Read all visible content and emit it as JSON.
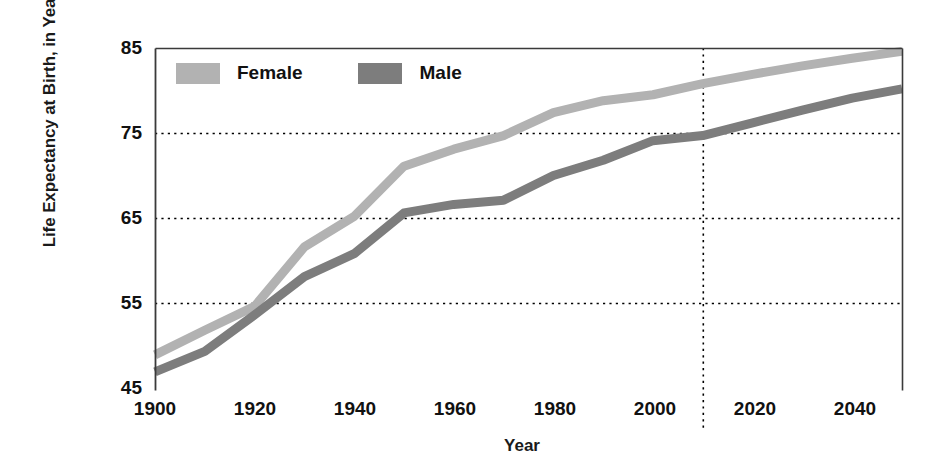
{
  "chart_data": {
    "type": "line",
    "title": "",
    "xlabel": "Year",
    "ylabel": "Life Expectancy at Birth, in Years",
    "xlim": [
      1900,
      2050
    ],
    "ylim": [
      45,
      85
    ],
    "xticks": [
      1900,
      1920,
      1940,
      1960,
      1980,
      2000,
      2020,
      2040
    ],
    "yticks": [
      45,
      55,
      65,
      75,
      85
    ],
    "grid": "horizontal dotted at 55, 65, 75; vertical dotted at 2010",
    "projection_line_year": 2010,
    "legend_position": "top-left inside plot",
    "series": [
      {
        "name": "Female",
        "color": "#b2b2b2",
        "x": [
          1900,
          1910,
          1920,
          1930,
          1940,
          1950,
          1960,
          1970,
          1980,
          1990,
          2000,
          2010,
          2020,
          2030,
          2040,
          2050
        ],
        "values": [
          48.9,
          51.8,
          54.6,
          61.6,
          65.2,
          71.1,
          73.1,
          74.7,
          77.4,
          78.8,
          79.5,
          80.8,
          81.9,
          82.9,
          83.8,
          84.6
        ]
      },
      {
        "name": "Male",
        "color": "#7d7d7d",
        "x": [
          1900,
          1910,
          1920,
          1930,
          1940,
          1950,
          1960,
          1970,
          1980,
          1990,
          2000,
          2010,
          2020,
          2030,
          2040,
          2050
        ],
        "values": [
          46.9,
          49.3,
          53.6,
          58.1,
          60.8,
          65.6,
          66.6,
          67.1,
          70.0,
          71.8,
          74.1,
          74.7,
          76.2,
          77.7,
          79.1,
          80.2
        ]
      }
    ]
  },
  "legend": {
    "items": [
      {
        "label": "Female",
        "color": "#b2b2b2"
      },
      {
        "label": "Male",
        "color": "#7d7d7d"
      }
    ]
  },
  "axes": {
    "y_title": "Life Expectancy at Birth, in Years",
    "x_title": "Year",
    "y_tick_labels": [
      "85",
      "75",
      "65",
      "55",
      "45"
    ],
    "x_tick_labels": [
      "1900",
      "1920",
      "1940",
      "1960",
      "1980",
      "2000",
      "2020",
      "2040"
    ]
  },
  "colors": {
    "female": "#b2b2b2",
    "male": "#7d7d7d",
    "axis": "#3a3a3a",
    "grid": "#000000",
    "text": "#111111",
    "background": "#ffffff"
  }
}
